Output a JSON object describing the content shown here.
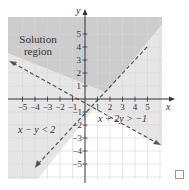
{
  "figure": {
    "axis_x_label": "x",
    "axis_y_label": "y",
    "region_label_line1": "Solution",
    "region_label_line2": "region",
    "inequality_1": "x + 2y > −1",
    "inequality_2": "x − y < 2",
    "x_ticks": [
      "−5",
      "−4",
      "−3",
      "−2",
      "−1",
      "1",
      "2",
      "3",
      "4",
      "5"
    ],
    "y_ticks_pos": [
      "5",
      "4",
      "3",
      "2",
      "1"
    ],
    "y_ticks_neg": [
      "−1",
      "−2",
      "−3",
      "−4",
      "−5"
    ],
    "colors": {
      "solution_region": "#c9c9c9",
      "single_region": "#e3e3e3",
      "grid": "#d9d9d9",
      "axis": "#333333",
      "boundary": "#555555"
    }
  },
  "checkbox": {
    "checked": false
  }
}
